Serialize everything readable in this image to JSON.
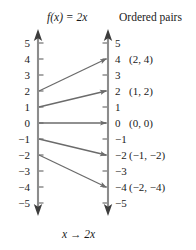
{
  "figure": {
    "width": 196,
    "height": 250,
    "background": "#ffffff",
    "axis_color": "#8c8c8c",
    "arrow_color": "#6b6b6b",
    "text_color": "#1a1a1a"
  },
  "headers": {
    "function_title": "f(x) = 2x",
    "ordered_pairs_title": "Ordered pairs"
  },
  "footer": {
    "mapping_label": "x → 2x"
  },
  "axes": {
    "left": {
      "name": "domain-axis",
      "x": 38,
      "top_y": 30,
      "bottom_y": 215,
      "tick_side": "right",
      "labels": [
        "5",
        "4",
        "3",
        "2",
        "1",
        "0",
        "−1",
        "−2",
        "−3",
        "−4",
        "−5"
      ],
      "values": [
        5,
        4,
        3,
        2,
        1,
        0,
        -1,
        -2,
        -3,
        -4,
        -5
      ],
      "tick_y": [
        43,
        59,
        75,
        91,
        107,
        123,
        139,
        155,
        171,
        187,
        203
      ]
    },
    "right": {
      "name": "range-axis",
      "x": 108,
      "top_y": 30,
      "bottom_y": 215,
      "tick_side": "left",
      "labels": [
        "5",
        "4",
        "3",
        "2",
        "1",
        "0",
        "−1",
        "−2",
        "−3",
        "−4",
        "−5"
      ],
      "values": [
        5,
        4,
        3,
        2,
        1,
        0,
        -1,
        -2,
        -3,
        -4,
        -5
      ],
      "tick_y": [
        43,
        59,
        75,
        91,
        107,
        123,
        139,
        155,
        171,
        187,
        203
      ]
    }
  },
  "chart_data": {
    "type": "mapping-diagram",
    "title": "f(x) = 2x",
    "xlabel": "x",
    "ylabel": "2x",
    "rule": "x → 2x",
    "axis_scale_min": -5,
    "axis_scale_max": 5,
    "left_axis_label": "f(x) = 2x",
    "right_axis_label": "Ordered pairs",
    "mappings": [
      {
        "x": 2,
        "y": 4,
        "from_y": 91,
        "to_y": 59,
        "pair": "(2, 4)",
        "pair_y": 59
      },
      {
        "x": 1,
        "y": 2,
        "from_y": 107,
        "to_y": 91,
        "pair": "(1, 2)",
        "pair_y": 91
      },
      {
        "x": 0,
        "y": 0,
        "from_y": 123,
        "to_y": 123,
        "pair": "(0, 0)",
        "pair_y": 123
      },
      {
        "x": -1,
        "y": -2,
        "from_y": 139,
        "to_y": 155,
        "pair": "(−1, −2)",
        "pair_y": 155
      },
      {
        "x": -2,
        "y": -4,
        "from_y": 155,
        "to_y": 187,
        "pair": "(−2, −4)",
        "pair_y": 187
      }
    ]
  }
}
